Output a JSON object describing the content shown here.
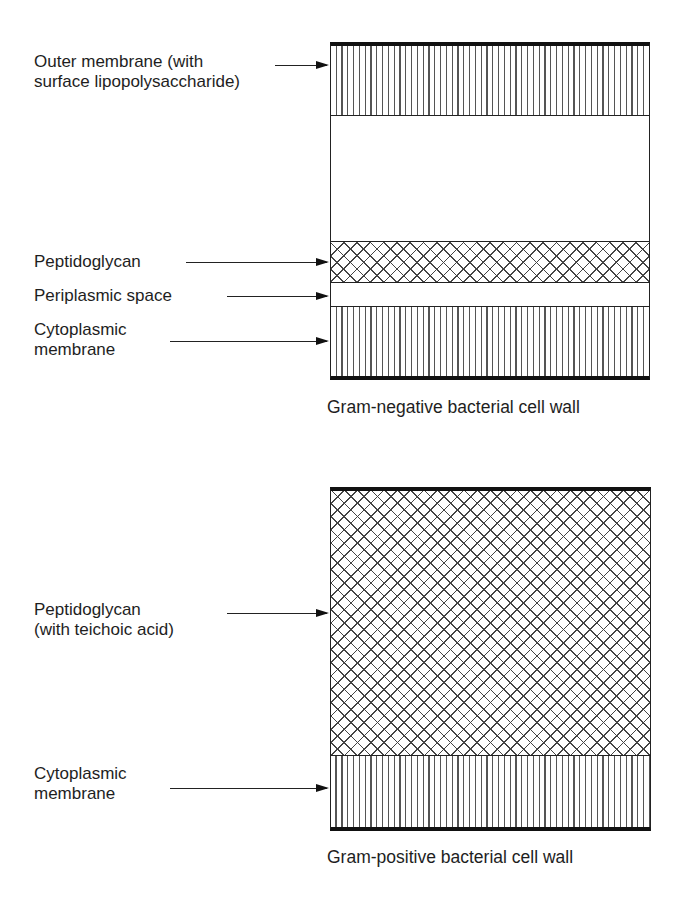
{
  "header": {
    "fragment": "Diagram"
  },
  "gram_negative": {
    "caption": "Gram-negative bacterial cell wall",
    "labels": {
      "outer_membrane_line1": "Outer membrane (with",
      "outer_membrane_line2": "surface lipopolysaccharide)",
      "peptidoglycan": "Peptidoglycan",
      "periplasmic_space": "Periplasmic space",
      "cytoplasmic_line1": "Cytoplasmic",
      "cytoplasmic_line2": "membrane"
    },
    "layers": [
      {
        "name": "Outer membrane",
        "pattern": "vertical-hatch"
      },
      {
        "name": "Outer space",
        "pattern": "blank"
      },
      {
        "name": "Peptidoglycan",
        "pattern": "cross-hatch"
      },
      {
        "name": "Periplasmic space",
        "pattern": "blank"
      },
      {
        "name": "Cytoplasmic membrane",
        "pattern": "vertical-hatch"
      }
    ]
  },
  "gram_positive": {
    "caption": "Gram-positive bacterial cell wall",
    "labels": {
      "peptidoglycan_line1": "Peptidoglycan",
      "peptidoglycan_line2": "(with teichoic acid)",
      "cytoplasmic_line1": "Cytoplasmic",
      "cytoplasmic_line2": "membrane"
    },
    "layers": [
      {
        "name": "Peptidoglycan (with teichoic acid)",
        "pattern": "cross-hatch"
      },
      {
        "name": "Cytoplasmic membrane",
        "pattern": "vertical-hatch"
      }
    ]
  }
}
